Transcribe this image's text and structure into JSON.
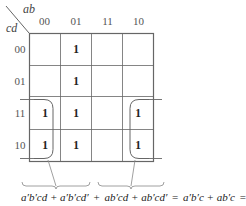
{
  "kmap": {
    "row_variable": "cd",
    "col_variable": "ab",
    "col_headers": [
      "00",
      "01",
      "11",
      "10"
    ],
    "row_headers": [
      "00",
      "01",
      "11",
      "10"
    ],
    "cells": [
      [
        "",
        "1",
        "",
        ""
      ],
      [
        "",
        "1",
        "",
        ""
      ],
      [
        "1",
        "1",
        "",
        "1"
      ],
      [
        "1",
        "1",
        "",
        "1"
      ]
    ],
    "groups": [
      {
        "name": "wrap-group-left",
        "cells": [
          [
            2,
            0
          ],
          [
            3,
            0
          ]
        ],
        "shape": "open-left"
      },
      {
        "name": "wrap-group-right",
        "cells": [
          [
            2,
            3
          ],
          [
            3,
            3
          ]
        ],
        "shape": "open-right"
      }
    ],
    "colors": {
      "grid": "#555555",
      "text": "#222222",
      "label": "#555555"
    }
  },
  "expression": {
    "left_part": "a′b′cd + a′b′cd′",
    "plus": "+",
    "right_part": "ab′cd + ab′cd′",
    "equals1": "=",
    "middle": "a′b′c + ab′c",
    "equals2": "=",
    "result": "b′c",
    "full": "a′b′cd + a′b′cd′ + ab′cd + ab′cd′ = a′b′c + ab′c = b′c"
  }
}
